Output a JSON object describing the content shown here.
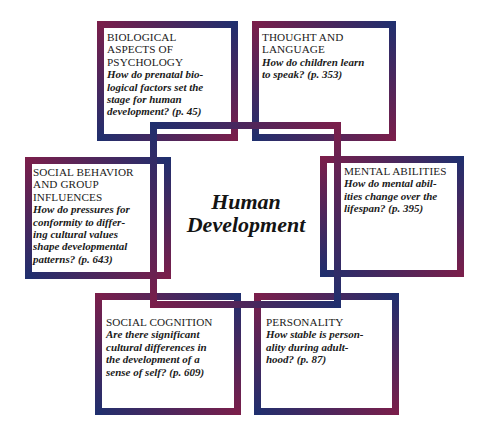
{
  "diagram": {
    "center": {
      "title": "Human\nDevelopment"
    },
    "boxes": [
      {
        "id": "biological",
        "title": "BIOLOGICAL\nASPECTS OF\nPSYCHOLOGY",
        "question": "How do prenatal bio-\nlogical factors set the\nstage for human\ndevelopment? (p. 45)"
      },
      {
        "id": "thought",
        "title": "THOUGHT AND\nLANGUAGE",
        "question": "How do children learn\nto speak? (p. 353)"
      },
      {
        "id": "social-behavior",
        "title": "SOCIAL BEHAVIOR\nAND GROUP\nINFLUENCES",
        "question": "How do pressures for\nconformity to differ-\ning cultural values\nshape developmental\npatterns? (p. 643)"
      },
      {
        "id": "mental",
        "title": "MENTAL ABILITIES",
        "question": "How do mental abil-\nities change over the\nlifespan? (p. 395)"
      },
      {
        "id": "social-cognition",
        "title": "SOCIAL COGNITION",
        "question": "Are there significant\ncultural differences in\nthe development of a\nsense of self? (p. 609)"
      },
      {
        "id": "personality",
        "title": "PERSONALITY",
        "question": "How stable is person-\nality during adult-\nhood? (p. 87)"
      }
    ],
    "colors": {
      "maroon": "#7b1e4a",
      "navy": "#1f2f6e",
      "background": "#ffffff",
      "text": "#1a1a1a"
    }
  }
}
